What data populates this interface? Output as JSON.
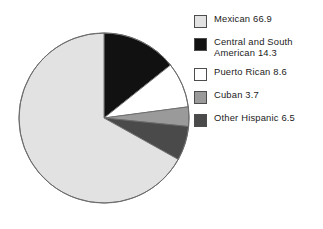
{
  "chart_data": {
    "type": "pie",
    "title": "",
    "subtitle": "",
    "xlabel": "",
    "ylabel": "",
    "grid": false,
    "legend_position": "right",
    "start_angle_deg": 0,
    "direction": "clockwise",
    "total": 100.0,
    "units": "percent",
    "categories": [
      "Mexican",
      "Central and South American",
      "Puerto Rican",
      "Cuban",
      "Other Hispanic"
    ],
    "values": [
      66.9,
      14.3,
      8.6,
      3.7,
      6.5
    ],
    "colors": [
      "#e2e2e2",
      "#111111",
      "#ffffff",
      "#9a9a9a",
      "#4a4a4a"
    ],
    "slices": [
      {
        "label": "Mexican",
        "value": 66.9,
        "color": "#e2e2e2",
        "legend_text": "Mexican 66.9",
        "start_deg": 33.1,
        "end_deg": 100.0
      },
      {
        "label": "Central and South American",
        "value": 14.3,
        "color": "#111111",
        "legend_text": "Central and South\nAmerican 14.3",
        "start_deg": 0.0,
        "end_deg": 14.3
      },
      {
        "label": "Puerto Rican",
        "value": 8.6,
        "color": "#ffffff",
        "legend_text": "Puerto Rican 8.6",
        "start_deg": 14.3,
        "end_deg": 22.9
      },
      {
        "label": "Cuban",
        "value": 3.7,
        "color": "#9a9a9a",
        "legend_text": "Cuban 3.7",
        "start_deg": 22.9,
        "end_deg": 26.6
      },
      {
        "label": "Other Hispanic",
        "value": 6.5,
        "color": "#4a4a4a",
        "legend_text": "Other Hispanic 6.5",
        "start_deg": 26.6,
        "end_deg": 33.1
      }
    ]
  },
  "pie": {
    "center_x": 104,
    "center_y": 118,
    "radius": 85,
    "outline_color": "#6b6b6b"
  },
  "legend": {
    "items": [
      {
        "label": "Mexican 66.9",
        "color": "#e2e2e2"
      },
      {
        "label": "Central and South\nAmerican 14.3",
        "color": "#111111"
      },
      {
        "label": "Puerto Rican 8.6",
        "color": "#ffffff"
      },
      {
        "label": "Cuban 3.7",
        "color": "#9a9a9a"
      },
      {
        "label": "Other Hispanic 6.5",
        "color": "#4a4a4a"
      }
    ]
  }
}
